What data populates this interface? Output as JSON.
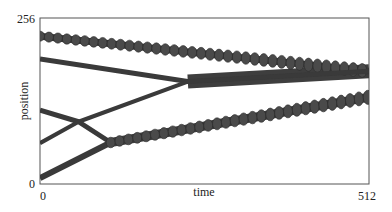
{
  "chart_data": {
    "type": "line",
    "title": "",
    "xlabel": "time",
    "ylabel": "position",
    "xlim": [
      0,
      512
    ],
    "ylim": [
      0,
      256
    ],
    "x_ticks": [
      "0",
      "512"
    ],
    "y_ticks": [
      "0",
      "256"
    ],
    "grid": false,
    "legend": null,
    "line_color": "#3a3a3a",
    "series": [
      {
        "name": "trajectory-1",
        "x": [
          0,
          512
        ],
        "y": [
          228,
          174
        ],
        "width": 7,
        "oscillation": "strong-pulsing"
      },
      {
        "name": "trajectory-2",
        "x": [
          0,
          230,
          512
        ],
        "y": [
          193,
          158,
          174
        ],
        "width": 5,
        "oscillation": "weak"
      },
      {
        "name": "trajectory-3",
        "x": [
          0,
          60,
          110
        ],
        "y": [
          114,
          96,
          64
        ],
        "width": 5,
        "oscillation": "weak"
      },
      {
        "name": "trajectory-4",
        "x": [
          0,
          60,
          230,
          512
        ],
        "y": [
          63,
          96,
          158,
          174
        ],
        "width": 4,
        "oscillation": "none-then-weak"
      },
      {
        "name": "trajectory-5",
        "x": [
          0,
          110,
          512
        ],
        "y": [
          9,
          64,
          134
        ],
        "width": 6,
        "oscillation": "strong-pulsing-after-merge"
      }
    ]
  }
}
